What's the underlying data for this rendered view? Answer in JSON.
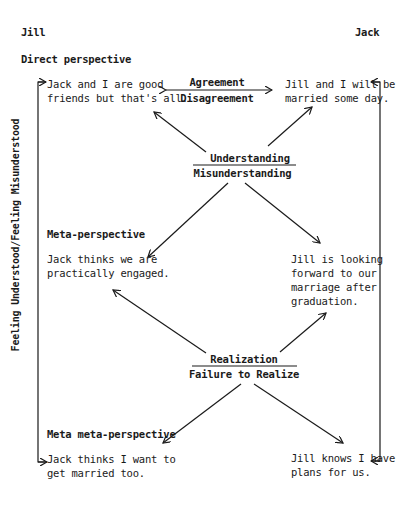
{
  "header": {
    "left_person": "Jill",
    "right_person": "Jack"
  },
  "levels": {
    "direct": {
      "label": "Direct perspective",
      "jill_text": [
        "Jack and I are good",
        "friends but that's all."
      ],
      "jack_text": [
        "Jill and I will be",
        "married some day."
      ],
      "connector": {
        "top": "Agreement",
        "bottom": "Disagreement"
      }
    },
    "understanding": {
      "top": "Understanding",
      "bottom": "Misunderstanding"
    },
    "meta": {
      "label": "Meta-perspective",
      "jill_text": [
        "Jack thinks we are",
        "practically engaged."
      ],
      "jack_text": [
        "Jill is looking",
        "forward to our",
        "marriage after",
        "graduation."
      ]
    },
    "realization": {
      "top": "Realization",
      "bottom": "Failure to Realize"
    },
    "meta_meta": {
      "label": "Meta meta-perspective",
      "jill_text": [
        "Jack thinks I want to",
        "get married too."
      ],
      "jack_text": [
        "Jill knows I have",
        "plans for us."
      ]
    }
  },
  "side_label": "Feeling Understood/Feeling Misunderstood",
  "colors": {
    "ink": "#1a1a1a",
    "background": "#ffffff"
  }
}
